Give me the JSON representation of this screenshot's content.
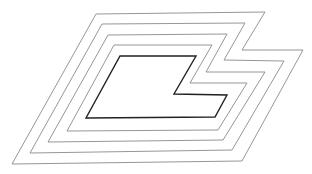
{
  "diagram": {
    "background": "#ffffff",
    "shapes": [
      {
        "id": "outline-1",
        "stroke": "#8a8a8a",
        "width": 0.9,
        "points": "96,14 265,12 242,50 303,50 242,161 12,164"
      },
      {
        "id": "outline-2",
        "stroke": "#8a8a8a",
        "width": 0.9,
        "points": "102,24 245,23 224,60 284,61 232,150 30,153"
      },
      {
        "id": "outline-3",
        "stroke": "#8a8a8a",
        "width": 0.9,
        "points": "108,35 227,34 206,72 265,72 223,140 48,142"
      },
      {
        "id": "outline-4",
        "stroke": "#8a8a8a",
        "width": 0.9,
        "points": "114,45 212,45 190,83 247,83 218,130 67,131"
      },
      {
        "id": "outline-5-inner",
        "stroke": "#222222",
        "width": 1.4,
        "points": "120,56 196,56 174,94 227,95 215,117 86,118"
      }
    ]
  }
}
